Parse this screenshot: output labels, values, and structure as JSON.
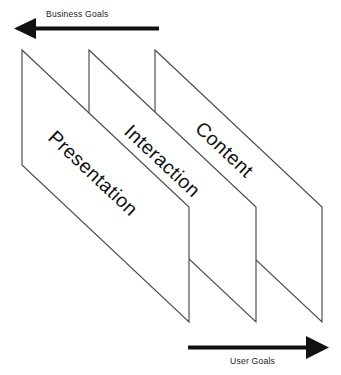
{
  "diagram": {
    "background_color": "#ffffff",
    "outline_color": "#4a4a4a",
    "arrow_color": "#111111",
    "text_color": "#111111",
    "axes": {
      "top": {
        "label": "Business Goals",
        "direction": "left",
        "arrow_name": "business-goals-arrow"
      },
      "bottom": {
        "label": "User Goals",
        "direction": "right",
        "arrow_name": "user-goals-arrow"
      }
    },
    "layers": [
      {
        "id": "presentation",
        "label": "Presentation",
        "order": 1,
        "position": "front-left"
      },
      {
        "id": "interaction",
        "label": "Interaction",
        "order": 2,
        "position": "middle"
      },
      {
        "id": "content",
        "label": "Content",
        "order": 3,
        "position": "back-right"
      }
    ]
  }
}
